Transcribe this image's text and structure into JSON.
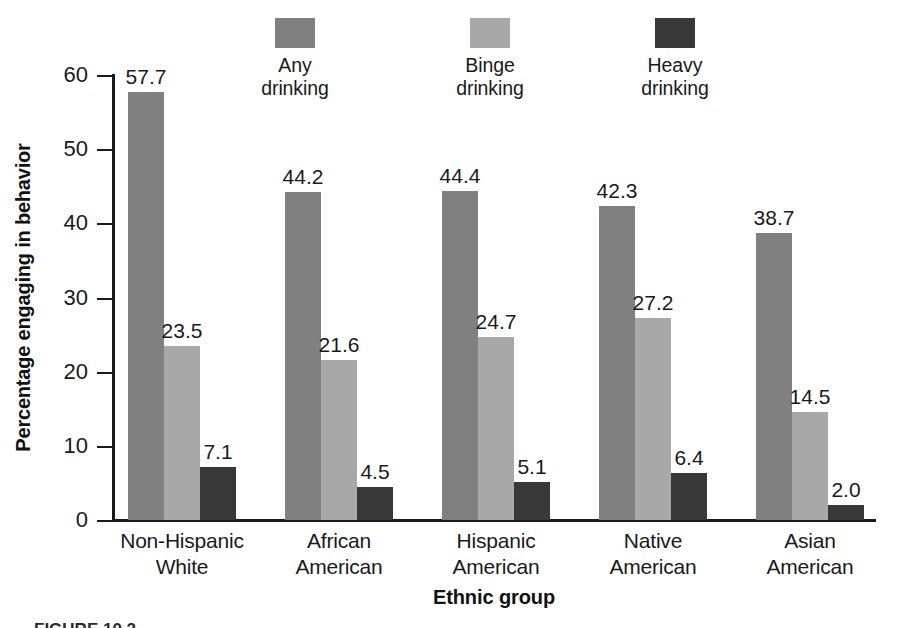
{
  "chart_data": {
    "type": "bar",
    "title": "",
    "xlabel": "Ethnic group",
    "ylabel": "Percentage engaging in behavior",
    "categories": [
      {
        "line1": "Non-Hispanic",
        "line2": "White"
      },
      {
        "line1": "African",
        "line2": "American"
      },
      {
        "line1": "Hispanic",
        "line2": "American"
      },
      {
        "line1": "Native",
        "line2": "American"
      },
      {
        "line1": "Asian",
        "line2": "American"
      }
    ],
    "series": [
      {
        "name": "Any drinking",
        "color": "#808080",
        "values": [
          57.7,
          44.2,
          44.4,
          42.3,
          38.7
        ]
      },
      {
        "name": "Binge drinking",
        "color": "#a8a8a8",
        "values": [
          23.5,
          21.6,
          24.7,
          27.2,
          14.5
        ]
      },
      {
        "name": "Heavy drinking",
        "color": "#383838",
        "values": [
          7.1,
          4.5,
          5.1,
          6.4,
          2.0
        ]
      }
    ],
    "ylim": [
      0,
      60
    ],
    "yticks": [
      0,
      10,
      20,
      30,
      40,
      50,
      60
    ],
    "ytick_labels": [
      "0",
      "10",
      "20",
      "30",
      "40",
      "50",
      "60"
    ],
    "grid": false,
    "legend_position": "top-center",
    "value_labels": true
  },
  "legend": [
    {
      "line1": "Any",
      "line2": "drinking",
      "color": "#808080"
    },
    {
      "line1": "Binge",
      "line2": "drinking",
      "color": "#a8a8a8"
    },
    {
      "line1": "Heavy",
      "line2": "drinking",
      "color": "#383838"
    }
  ],
  "axes": {
    "y_title": "Percentage engaging in behavior",
    "x_title": "Ethnic group",
    "y_ticks": [
      "60",
      "50",
      "40",
      "30",
      "20",
      "10",
      "0"
    ]
  },
  "bar_values": {
    "g0": {
      "s0": "57.7",
      "s1": "23.5",
      "s2": "7.1"
    },
    "g1": {
      "s0": "44.2",
      "s1": "21.6",
      "s2": "4.5"
    },
    "g2": {
      "s0": "44.4",
      "s1": "24.7",
      "s2": "5.1"
    },
    "g3": {
      "s0": "42.3",
      "s1": "27.2",
      "s2": "6.4"
    },
    "g4": {
      "s0": "38.7",
      "s1": "14.5",
      "s2": "2.0"
    }
  },
  "x_labels": {
    "g0": {
      "line1": "Non-Hispanic",
      "line2": "White"
    },
    "g1": {
      "line1": "African",
      "line2": "American"
    },
    "g2": {
      "line1": "Hispanic",
      "line2": "American"
    },
    "g3": {
      "line1": "Native",
      "line2": "American"
    },
    "g4": {
      "line1": "Asian",
      "line2": "American"
    }
  },
  "caption": "FIGURE 10.2"
}
